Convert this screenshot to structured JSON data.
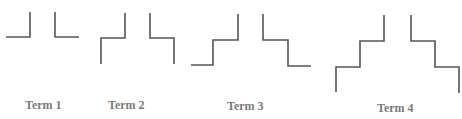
{
  "diagram": {
    "stroke_color": "#555555",
    "label_color": "#7a7a7a",
    "terms": [
      {
        "label": "Term 1",
        "label_pos": [
          25,
          98
        ],
        "shapes": [
          {
            "name": "left-step",
            "points": "6,37 30,37 30,12"
          },
          {
            "name": "right-step",
            "points": "55,12 55,37 79,37"
          }
        ]
      },
      {
        "label": "Term 2",
        "label_pos": [
          108,
          98
        ],
        "shapes": [
          {
            "name": "left-step",
            "points": "101,64 101,38 125,38 125,13"
          },
          {
            "name": "right-step",
            "points": "150,13 150,38 174,38 174,64"
          }
        ]
      },
      {
        "label": "Term 3",
        "label_pos": [
          227,
          99
        ],
        "shapes": [
          {
            "name": "left-step",
            "points": "191,65 213,65 213,40 238,40 238,14"
          },
          {
            "name": "right-step",
            "points": "263,14 263,40 288,40 288,66 311,66"
          }
        ]
      },
      {
        "label": "Term 4",
        "label_pos": [
          377,
          101
        ],
        "shapes": [
          {
            "name": "left-step",
            "points": "336,92 336,67 360,67 360,41 384,41 384,15"
          },
          {
            "name": "right-step",
            "points": "411,15 411,41 435,41 435,67 459,67 459,93"
          }
        ]
      }
    ]
  }
}
